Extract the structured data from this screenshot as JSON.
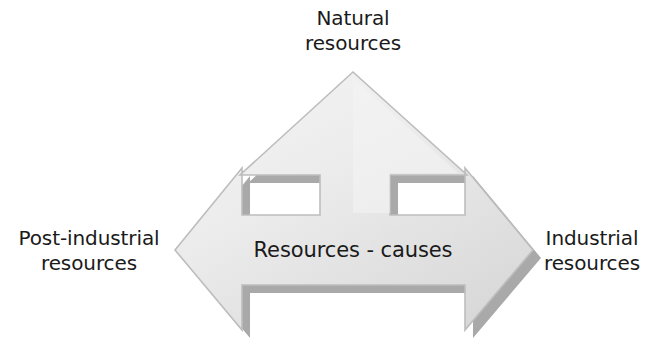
{
  "diagram": {
    "type": "three-way-arrow",
    "center_label": "Resources - causes",
    "labels": {
      "top": "Natural\nresources",
      "left": "Post-industrial\nresources",
      "right": "Industrial\nresources"
    },
    "colors": {
      "arrow_fill_light": "#f2f2f2",
      "arrow_fill_dark": "#d8d8d8",
      "arrow_outline": "#b3b3b3",
      "arrow_shadow": "#8c8c8c",
      "text": "#1a1a1a",
      "background": "#ffffff"
    },
    "directions": [
      {
        "name": "up",
        "points_to": "Natural resources"
      },
      {
        "name": "left",
        "points_to": "Post-industrial resources"
      },
      {
        "name": "right",
        "points_to": "Industrial resources"
      }
    ]
  }
}
